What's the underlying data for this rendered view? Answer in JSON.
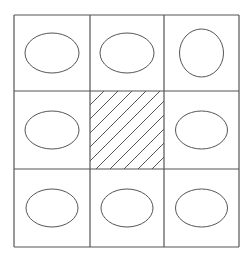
{
  "diagram": {
    "type": "3x3 grid puzzle",
    "line_color": "#555555",
    "background": "#ffffff",
    "grid": {
      "x": [
        14,
        90,
        164,
        239
      ],
      "y": [
        15,
        91,
        169,
        247
      ]
    },
    "cells": [
      {
        "row": 0,
        "col": 0,
        "shape": "ellipse",
        "rx": 27,
        "ry": 20
      },
      {
        "row": 0,
        "col": 1,
        "shape": "ellipse",
        "rx": 27,
        "ry": 20
      },
      {
        "row": 0,
        "col": 2,
        "shape": "ellipse",
        "rx": 22,
        "ry": 24
      },
      {
        "row": 1,
        "col": 0,
        "shape": "ellipse",
        "rx": 27,
        "ry": 19
      },
      {
        "row": 1,
        "col": 1,
        "shape": "hatched",
        "hatch_spacing": 14
      },
      {
        "row": 1,
        "col": 2,
        "shape": "ellipse",
        "rx": 26,
        "ry": 19
      },
      {
        "row": 2,
        "col": 0,
        "shape": "ellipse",
        "rx": 26,
        "ry": 19
      },
      {
        "row": 2,
        "col": 1,
        "shape": "ellipse",
        "rx": 26,
        "ry": 19
      },
      {
        "row": 2,
        "col": 2,
        "shape": "ellipse",
        "rx": 26,
        "ry": 19
      }
    ]
  }
}
